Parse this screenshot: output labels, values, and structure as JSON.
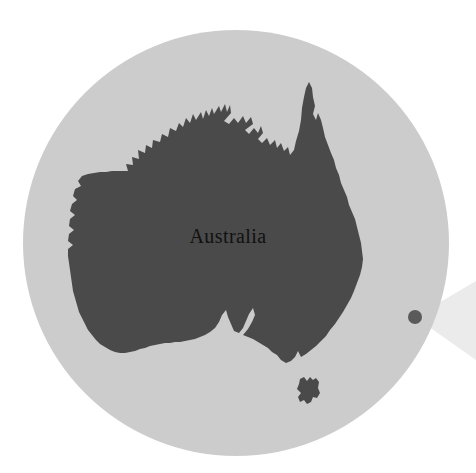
{
  "figure": {
    "type": "locator-map",
    "background_color": "#ffffff",
    "width": 476,
    "height": 473
  },
  "globe": {
    "name": "globe-circle",
    "fill_color": "#cccccc",
    "center_x": 236,
    "center_y": 243,
    "radius": 213
  },
  "landmass": {
    "name": "australia-mainland",
    "label": "Australia",
    "fill_color": "#4a4a4a"
  },
  "island": {
    "name": "tasmania-island",
    "fill_color": "#4a4a4a"
  },
  "marker": {
    "name": "location-marker-dot",
    "fill_color": "#5a5a5a",
    "center_x": 415,
    "center_y": 317,
    "radius": 7
  },
  "callout": {
    "name": "callout-cone",
    "fill_color": "#ebebeb",
    "apex_x": 415,
    "apex_y": 317
  }
}
